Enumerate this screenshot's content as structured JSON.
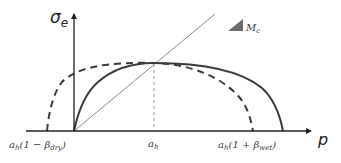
{
  "diagram": {
    "axes": {
      "y_label": "σ",
      "y_label_sub": "e",
      "x_label": "p"
    },
    "labels": {
      "slope_label_main": "M",
      "slope_label_sub": "c",
      "ah_main": "a",
      "ah_sub": "h",
      "dry_prefix": "a",
      "dry_prefix_sub": "h",
      "dry_body": "(1 − β",
      "dry_sub": "dry",
      "dry_close": ")",
      "wet_prefix": "a",
      "wet_prefix_sub": "h",
      "wet_body": "(1 + β",
      "wet_sub": "wet",
      "wet_close": ")"
    },
    "colors": {
      "axis": "#222222",
      "solid_curve": "#3a3a3a",
      "dashed_curve": "#3a3a3a",
      "critical_state_line": "#8a8a8a",
      "slope_triangle": "#6b6b6b",
      "guide_line": "#9a9a9a"
    },
    "legend": [
      {
        "name": "Yield surface (current)",
        "style": "solid"
      },
      {
        "name": "Yield surface (alternate)",
        "style": "dashed"
      },
      {
        "name": "Critical state line",
        "style": "thin",
        "slope": "M_c"
      }
    ]
  }
}
